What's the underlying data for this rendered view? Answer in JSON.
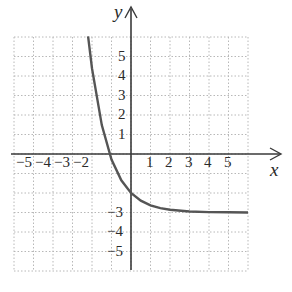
{
  "chart_data": {
    "type": "line",
    "title": "",
    "xlabel": "x",
    "ylabel": "y",
    "xlim": [
      -6,
      6
    ],
    "ylim": [
      -6,
      6
    ],
    "grid": true,
    "x_ticks": [
      "-5",
      "-4",
      "-3",
      "-2",
      "1",
      "2",
      "3",
      "4",
      "5"
    ],
    "y_ticks": [
      "5",
      "4",
      "3",
      "2",
      "1",
      "-3",
      "-4",
      "-5"
    ],
    "series": [
      {
        "name": "curve",
        "description": "decreasing exponential with horizontal asymptote y = -3, y-intercept -2",
        "x": [
          -2.2,
          -2,
          -1.5,
          -1,
          -0.5,
          0,
          0.5,
          1,
          1.5,
          2,
          3,
          4,
          5,
          6
        ],
        "y": [
          6.03,
          4.39,
          1.48,
          -0.28,
          -1.35,
          -2,
          -2.39,
          -2.63,
          -2.78,
          -2.86,
          -2.95,
          -2.98,
          -2.99,
          -3.0
        ]
      }
    ],
    "asymptote": {
      "y": -3
    }
  },
  "labels": {
    "x_axis": "x",
    "y_axis": "y",
    "xt": {
      "m5": "−5",
      "m4": "−4",
      "m3": "−3",
      "m2": "−2",
      "p1": "1",
      "p2": "2",
      "p3": "3",
      "p4": "4",
      "p5": "5"
    },
    "yt": {
      "p5": "5",
      "p4": "4",
      "p3": "3",
      "p2": "2",
      "p1": "1",
      "m3": "−3",
      "m4": "−4",
      "m5": "−5"
    }
  }
}
